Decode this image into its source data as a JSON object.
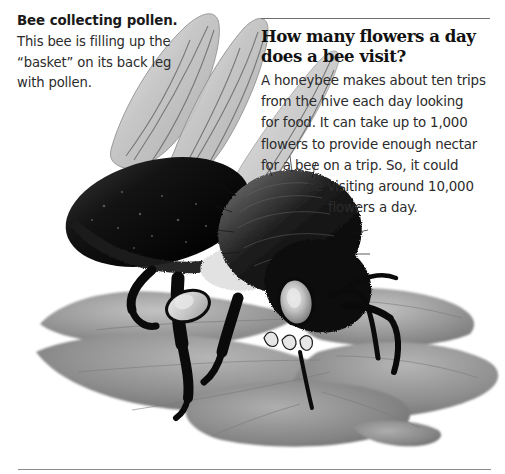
{
  "page": {
    "background_color": "#ffffff",
    "text_color": "#2b2b2b",
    "rule_color": "#6f6f6f"
  },
  "caption": {
    "heading": "Bee collecting pollen.",
    "body_lines": [
      "This bee is filling up the",
      "“basket” on its back leg",
      "with pollen."
    ],
    "body_text": "This bee is filling up the “basket” on its back leg with pollen."
  },
  "article": {
    "heading_lines": [
      "How many flowers a day",
      "does a bee visit?"
    ],
    "heading_text": "How many flowers a day does a bee visit?",
    "body_lines": [
      {
        "text": "A honeybee makes about ten trips",
        "indent": 0
      },
      {
        "text": "from the hive each day looking",
        "indent": 0
      },
      {
        "text": "for food. It can take up to 1,000",
        "indent": 0
      },
      {
        "text": "flowers to provide enough nectar",
        "indent": 0
      },
      {
        "text": "for a bee on a trip. So, it could",
        "indent": 0
      },
      {
        "text": "be visiting around 10,000",
        "indent": 1
      },
      {
        "text": "flowers a day.",
        "indent": 2
      }
    ],
    "body_text": "A honeybee makes about ten trips from the hive each day looking for food. It can take up to 1,000 flowers to provide enough nectar for a bee on a trip. So, it could be visiting around 10,000 flowers a day."
  },
  "illustration": {
    "description": "Grayscale photograph of a bumblebee standing on a pale gray flower, collecting pollen",
    "subject": "bumblebee-on-flower",
    "colors": {
      "petal_light": "#b9b9b9",
      "petal_mid": "#8d8d8d",
      "petal_dark": "#6d6d6d",
      "body_dark": "#121212",
      "body_fuzz": "#3a3a3a",
      "wing": "#c9c9c9",
      "wing_vein": "#6a6a6a",
      "eye_light": "#d8d8d8"
    }
  }
}
